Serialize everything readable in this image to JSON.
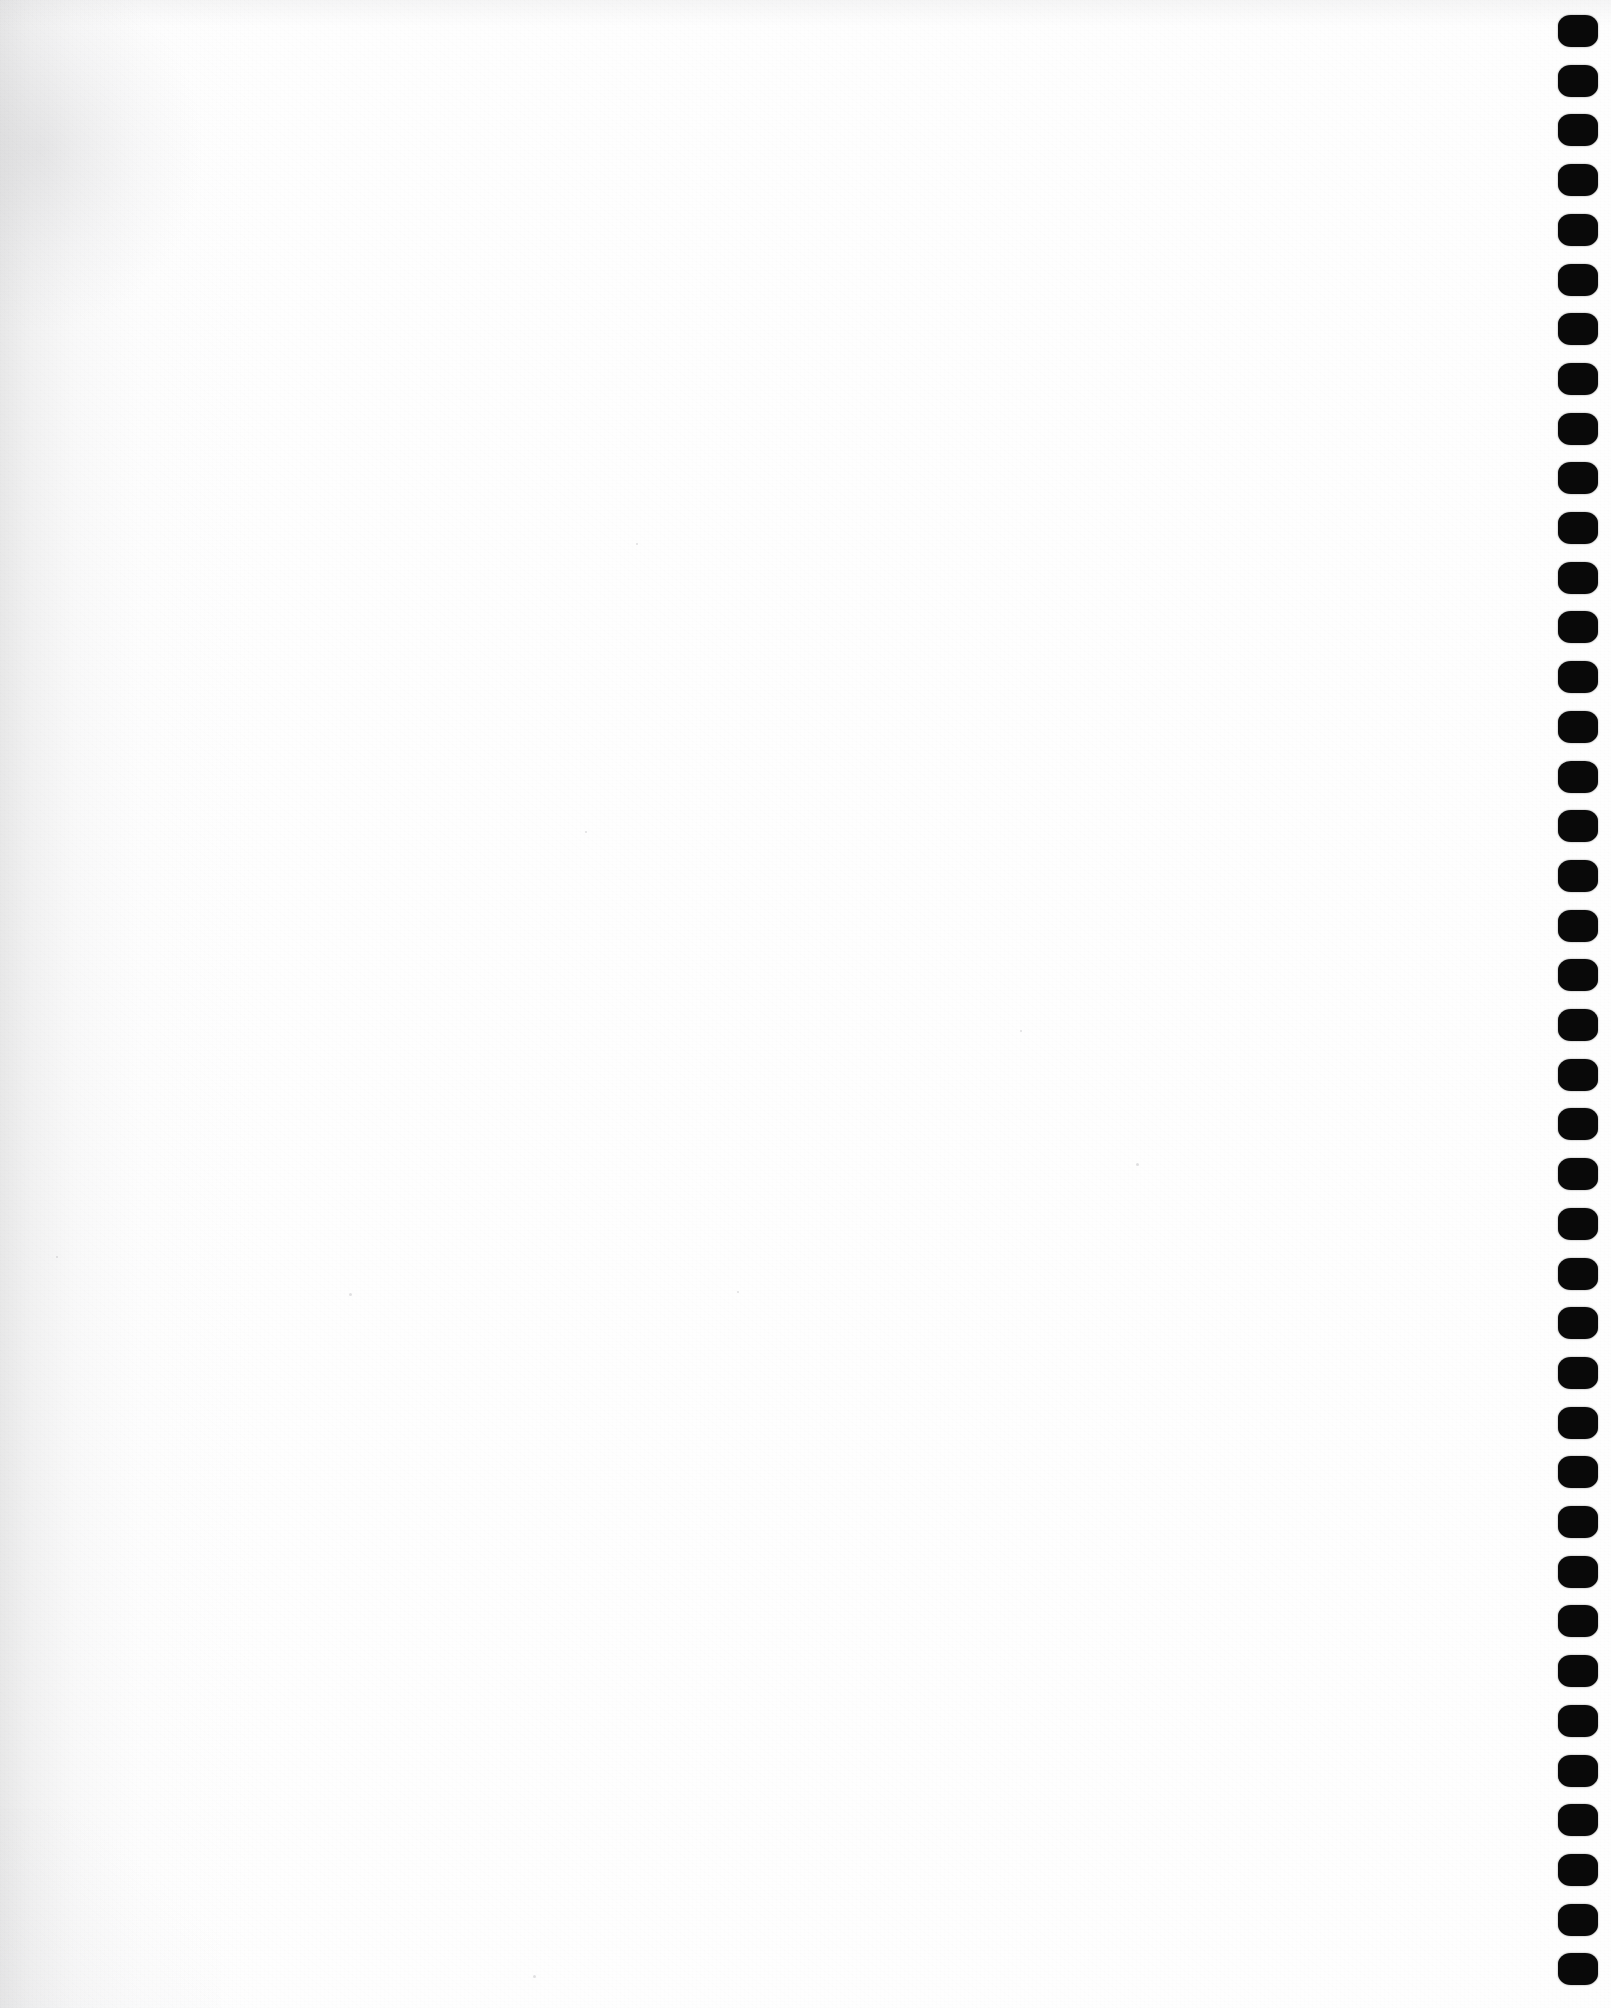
{
  "document": {
    "kind": "scanned-page",
    "page_content": "",
    "page_text": "",
    "is_blank": true,
    "orientation": "portrait"
  },
  "canvas": {
    "width": 1611,
    "height": 2008,
    "background_color": "#ffffff",
    "paper_color": "#fefefe"
  },
  "paper": {
    "left_shade_color": "#a8a8aa",
    "left_shade_width": 260,
    "corner_smudge_color": "#96969b",
    "grain_opacity": 0.55,
    "specks": [
      {
        "x": 1136,
        "y": 1163,
        "size": 3
      },
      {
        "x": 1020,
        "y": 1030,
        "size": 2
      },
      {
        "x": 349,
        "y": 1293,
        "size": 3
      },
      {
        "x": 737,
        "y": 1291,
        "size": 2
      },
      {
        "x": 533,
        "y": 1975,
        "size": 3
      },
      {
        "x": 636,
        "y": 543,
        "size": 2
      },
      {
        "x": 56,
        "y": 1256,
        "size": 2
      },
      {
        "x": 585,
        "y": 831,
        "size": 2
      }
    ]
  },
  "binding_holes": {
    "label": "punched binding hole column",
    "edge": "right",
    "shape": "rounded-square",
    "color": "#090909",
    "count": 40,
    "dot_width": 40,
    "dot_height": 32,
    "first_center_y": 31,
    "spacing_y": 49.7,
    "center_x": 1578
  }
}
